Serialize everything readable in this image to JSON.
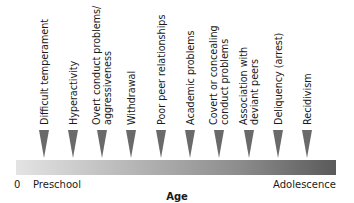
{
  "diagram": {
    "stages": [
      {
        "lines": [
          "Difficult temperament"
        ],
        "x": 44
      },
      {
        "lines": [
          "Hyperactivity"
        ],
        "x": 73
      },
      {
        "lines": [
          "Overt conduct problems/",
          "aggressiveness"
        ],
        "x": 102
      },
      {
        "lines": [
          "Withdrawal"
        ],
        "x": 131
      },
      {
        "lines": [
          "Poor peer relationships"
        ],
        "x": 161
      },
      {
        "lines": [
          "Academic problems"
        ],
        "x": 190
      },
      {
        "lines": [
          "Covert or concealing",
          "conduct problems"
        ],
        "x": 219
      },
      {
        "lines": [
          "Association with",
          "deviant peers"
        ],
        "x": 249
      },
      {
        "lines": [
          "Deliquency (arrest)"
        ],
        "x": 278
      },
      {
        "lines": [
          "Recidivism"
        ],
        "x": 307
      }
    ],
    "axis": {
      "zero_label": "0",
      "start_label": "Preschool",
      "end_label": "Adolescence",
      "title": "Age"
    },
    "colors": {
      "arrow": "#6a6a6a",
      "bar_start": "#e4e4e4",
      "bar_end": "#5a5a5a"
    }
  }
}
